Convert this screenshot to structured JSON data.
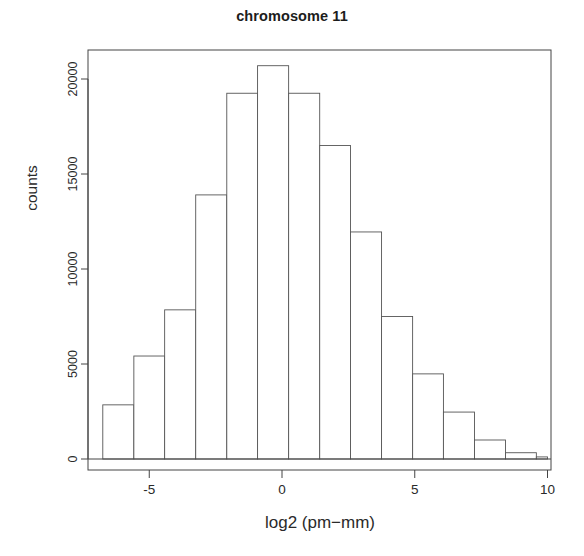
{
  "chart_data": {
    "type": "bar",
    "title": "chromosome 11",
    "xlabel": "log2 (pm−mm)",
    "ylabel": "counts",
    "xlim": [
      -6.95,
      10.15
    ],
    "ylim": [
      0,
      21500
    ],
    "grid": false,
    "legend": null,
    "bin_width": 1.1667,
    "xticks": [
      -5,
      0,
      5,
      10
    ],
    "xtick_labels": [
      "-5",
      "0",
      "5",
      "10"
    ],
    "yticks": [
      0,
      5000,
      10000,
      15000,
      20000
    ],
    "ytick_labels": [
      "0",
      "5000",
      "10000",
      "15000",
      "20000"
    ],
    "bins": [
      {
        "left": -6.75,
        "right": -5.58,
        "value": 2850
      },
      {
        "left": -5.58,
        "right": -4.42,
        "value": 5420
      },
      {
        "left": -4.42,
        "right": -3.25,
        "value": 7850
      },
      {
        "left": -3.25,
        "right": -2.08,
        "value": 13900
      },
      {
        "left": -2.08,
        "right": -0.92,
        "value": 19250
      },
      {
        "left": -0.92,
        "right": 0.25,
        "value": 20700
      },
      {
        "left": 0.25,
        "right": 1.42,
        "value": 19250
      },
      {
        "left": 1.42,
        "right": 2.58,
        "value": 16500
      },
      {
        "left": 2.58,
        "right": 3.75,
        "value": 11950
      },
      {
        "left": 3.75,
        "right": 4.92,
        "value": 7500
      },
      {
        "left": 4.92,
        "right": 6.08,
        "value": 4480
      },
      {
        "left": 6.08,
        "right": 7.25,
        "value": 2470
      },
      {
        "left": 7.25,
        "right": 8.42,
        "value": 1000
      },
      {
        "left": 8.42,
        "right": 9.58,
        "value": 330
      },
      {
        "left": 9.58,
        "right": 10.0,
        "value": 110
      }
    ],
    "categories": [
      "-6.2",
      "-5.0",
      "-3.8",
      "-2.7",
      "-1.5",
      "-0.3",
      "0.8",
      "2.0",
      "3.2",
      "4.3",
      "5.5",
      "6.7",
      "7.8",
      "9.0",
      "9.8"
    ],
    "values": [
      2850,
      5420,
      7850,
      13900,
      19250,
      20700,
      19250,
      16500,
      11950,
      7500,
      4480,
      2470,
      1000,
      330,
      110
    ],
    "style": {
      "bar_fill": "#ffffff",
      "bar_stroke": "#555555",
      "axis_color": "#444444",
      "text_color": "#2a2a2a",
      "background": "#ffffff"
    }
  }
}
